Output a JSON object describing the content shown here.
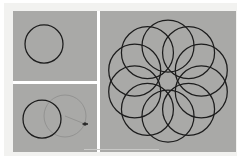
{
  "figure": {
    "background_color": "#ffffff",
    "frame_color": "#f2f2f0",
    "panel_background_color": "#a9a9a7",
    "divider_color": "#ffffff",
    "stroke_color": "#1c1c1c",
    "ghost_stroke_color": "#8d8d8b",
    "panel_count": 3
  },
  "panels": [
    {
      "name": "top-left",
      "label": "Single circle",
      "x": 0,
      "y": 0,
      "width": 84,
      "height": 70,
      "circles": [
        {
          "cx": 31,
          "cy": 33,
          "r": 19,
          "style": "solid"
        }
      ]
    },
    {
      "name": "bottom-left",
      "label": "Circle with drag preview",
      "x": 0,
      "y": 73,
      "width": 84,
      "height": 68,
      "circles": [
        {
          "cx": 29,
          "cy": 35,
          "r": 19,
          "style": "solid"
        },
        {
          "cx": 52,
          "cy": 32,
          "r": 21,
          "style": "ghost"
        }
      ],
      "handle": {
        "cx": 72,
        "cy": 40,
        "r": 1.6,
        "label": "drag-handle"
      }
    },
    {
      "name": "right",
      "label": "Ten-circle rosette",
      "x": 87,
      "y": 0,
      "width": 136,
      "height": 141,
      "rosette": {
        "count": 10,
        "center_x": 68,
        "center_y": 70,
        "ring_radius": 35,
        "circle_radius": 26,
        "start_angle_deg": -90,
        "style": "solid"
      }
    }
  ],
  "chart_data": {
    "type": "scatter",
    "xlabel": "",
    "ylabel": "",
    "series": [
      {
        "name": "panel-top-left-circles",
        "points": [
          {
            "cx": 31,
            "cy": 33,
            "r": 19
          }
        ]
      },
      {
        "name": "panel-bottom-left-circles",
        "points": [
          {
            "cx": 29,
            "cy": 35,
            "r": 19
          },
          {
            "cx": 52,
            "cy": 32,
            "r": 21
          }
        ]
      },
      {
        "name": "panel-right-rosette-circles",
        "points": [
          {
            "cx": 68.0,
            "cy": 35.0,
            "r": 26
          },
          {
            "cx": 88.6,
            "cy": 39.2,
            "r": 26
          },
          {
            "cx": 101.3,
            "cy": 56.0,
            "r": 26
          },
          {
            "cx": 101.3,
            "cy": 84.0,
            "r": 26
          },
          {
            "cx": 88.6,
            "cy": 100.8,
            "r": 26
          },
          {
            "cx": 68.0,
            "cy": 105.0,
            "r": 26
          },
          {
            "cx": 47.4,
            "cy": 100.8,
            "r": 26
          },
          {
            "cx": 34.7,
            "cy": 84.0,
            "r": 26
          },
          {
            "cx": 34.7,
            "cy": 56.0,
            "r": 26
          },
          {
            "cx": 47.4,
            "cy": 39.2,
            "r": 26
          }
        ]
      }
    ],
    "grid": false,
    "legend": "none"
  }
}
